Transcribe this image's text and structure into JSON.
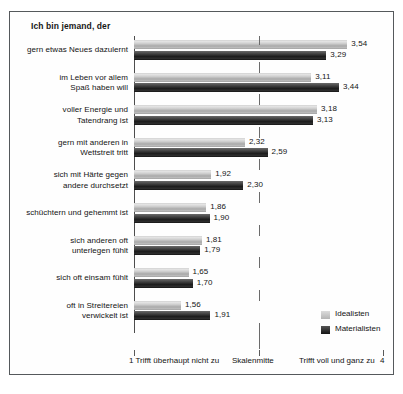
{
  "scan": {
    "top_cropped_text": "",
    "top_cropped_text_right": ""
  },
  "chart_data": {
    "type": "bar",
    "orientation": "horizontal",
    "title": "Ich bin jemand, der",
    "xlabel": "",
    "ylabel": "",
    "xlim": [
      1,
      4
    ],
    "grid": false,
    "legend_position": "bottom-right",
    "axis_labels": {
      "min_value": "1",
      "min_text": "Trifft überhaupt nicht zu",
      "mid_text": "Skalenmitte",
      "max_text": "Trifft voll und ganz zu",
      "max_value": "4"
    },
    "categories": [
      "gern etwas Neues dazulernt",
      "im Leben vor allem\nSpaß haben will",
      "voller Energie und\nTatendrang ist",
      "gern mit anderen in\nWettstreit tritt",
      "sich mit Härte gegen\nandere durchsetzt",
      "schüchtern und gehemmt ist",
      "sich anderen oft\nunterlegen fühlt",
      "sich oft einsam fühlt",
      "oft in Streitereien\nverwickelt ist"
    ],
    "series": [
      {
        "name": "Idealisten",
        "color": "#c0c0c0",
        "values": [
          3.54,
          3.11,
          3.18,
          2.32,
          1.92,
          1.86,
          1.81,
          1.65,
          1.56
        ],
        "labels": [
          "3,54",
          "3,11",
          "3,18",
          "2,32",
          "1,92",
          "1,86",
          "1,81",
          "1,65",
          "1,56"
        ]
      },
      {
        "name": "Materialisten",
        "color": "#1c1c1c",
        "values": [
          3.29,
          3.44,
          3.13,
          2.59,
          2.3,
          1.9,
          1.79,
          1.7,
          1.91
        ],
        "labels": [
          "3,29",
          "3,44",
          "3,13",
          "2,59",
          "2,30",
          "1,90",
          "1,79",
          "1,70",
          "1,91"
        ]
      }
    ]
  }
}
